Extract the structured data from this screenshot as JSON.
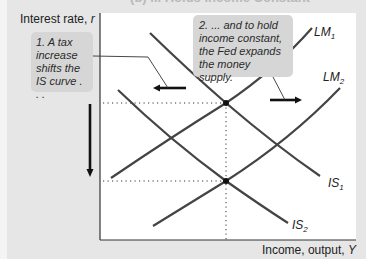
{
  "figure": {
    "title_clipped": "(b) ... Holds Income Constant",
    "y_axis_label": "Interest rate, ",
    "y_axis_symbol": "r",
    "x_axis_label": "Income, output, ",
    "x_axis_symbol": "Y"
  },
  "callouts": [
    {
      "id": 1,
      "text": "1. A tax increase shifts the IS curve . . ."
    },
    {
      "id": 2,
      "text": "2. ... and to hold income constant, the Fed expands the money supply."
    }
  ],
  "curves": [
    {
      "name": "LM1",
      "base": "LM",
      "sub": "1",
      "type": "upward"
    },
    {
      "name": "LM2",
      "base": "LM",
      "sub": "2",
      "type": "upward"
    },
    {
      "name": "IS1",
      "base": "IS",
      "sub": "1",
      "type": "downward"
    },
    {
      "name": "IS2",
      "base": "IS",
      "sub": "2",
      "type": "downward"
    }
  ],
  "arrows": [
    {
      "name": "IS shift arrow",
      "direction": "left"
    },
    {
      "name": "LM shift arrow",
      "direction": "right"
    },
    {
      "name": "interest rate change arrow",
      "direction": "down"
    }
  ],
  "equilibria": [
    {
      "label": "initial equilibrium",
      "curves": [
        "IS1",
        "LM1"
      ]
    },
    {
      "label": "new equilibrium",
      "curves": [
        "IS2",
        "LM2"
      ]
    }
  ],
  "colors": {
    "background": "#e6e6e6",
    "plot": "#ffffff",
    "callout": "#d6d6d6",
    "curve": "#333333"
  }
}
